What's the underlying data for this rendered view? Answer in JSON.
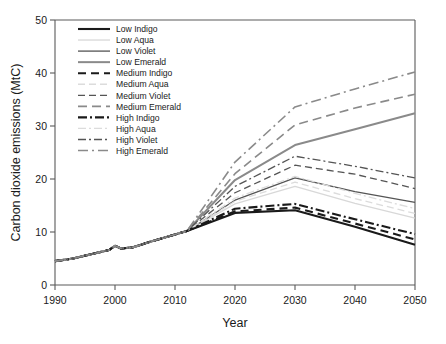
{
  "chart_data": {
    "type": "line",
    "title": "",
    "xlabel": "Year",
    "ylabel": "Carbon dioxide emissions (MtC)",
    "xlim": [
      1990,
      2050
    ],
    "ylim": [
      0,
      50
    ],
    "xticks": [
      1990,
      2000,
      2010,
      2020,
      2030,
      2040,
      2050
    ],
    "yticks": [
      0,
      10,
      20,
      30,
      40,
      50
    ],
    "grid": false,
    "legend_position": "top-left",
    "x": [
      1990,
      1993,
      1996,
      1999,
      2000,
      2001,
      2003,
      2006,
      2009,
      2012,
      2020,
      2030,
      2040,
      2050
    ],
    "series": [
      {
        "name": "Low  Indigo",
        "color": "#1a1a1a",
        "dash": "solid",
        "width": 2.1,
        "values": [
          4.5,
          5.0,
          5.8,
          6.6,
          7.4,
          6.9,
          7.1,
          8.2,
          9.2,
          10.2,
          13.6,
          14.1,
          11.0,
          7.6
        ]
      },
      {
        "name": "Low Aqua",
        "color": "#d8d8d8",
        "dash": "solid",
        "width": 1.3,
        "values": [
          4.5,
          5.0,
          5.8,
          6.6,
          7.4,
          6.9,
          7.1,
          8.2,
          9.2,
          10.2,
          15.3,
          18.6,
          15.4,
          12.6
        ]
      },
      {
        "name": "Low Violet",
        "color": "#555555",
        "dash": "solid",
        "width": 1.3,
        "values": [
          4.5,
          5.0,
          5.8,
          6.6,
          7.4,
          6.9,
          7.1,
          8.2,
          9.2,
          10.2,
          16.0,
          20.2,
          17.6,
          15.6
        ]
      },
      {
        "name": "Low Emerald",
        "color": "#8a8a8a",
        "dash": "solid",
        "width": 2.0,
        "values": [
          4.5,
          5.0,
          5.8,
          6.6,
          7.4,
          6.9,
          7.1,
          8.2,
          9.2,
          10.2,
          19.8,
          26.4,
          29.4,
          32.4
        ]
      },
      {
        "name": "Medium Indigo",
        "color": "#1a1a1a",
        "dash": "8,5",
        "width": 2.1,
        "values": [
          4.5,
          5.0,
          5.8,
          6.6,
          7.4,
          6.9,
          7.1,
          8.2,
          9.2,
          10.2,
          13.9,
          14.6,
          11.6,
          8.6
        ]
      },
      {
        "name": "Medium Aqua",
        "color": "#dcdcdc",
        "dash": "7,4",
        "width": 1.3,
        "values": [
          4.5,
          5.0,
          5.8,
          6.6,
          7.4,
          6.9,
          7.1,
          8.2,
          9.2,
          10.2,
          15.8,
          19.4,
          16.3,
          13.5
        ]
      },
      {
        "name": "Medium Violet",
        "color": "#555555",
        "dash": "7,4",
        "width": 1.3,
        "values": [
          4.5,
          5.0,
          5.8,
          6.6,
          7.4,
          6.9,
          7.1,
          8.2,
          9.2,
          10.2,
          17.4,
          22.6,
          20.9,
          18.2
        ]
      },
      {
        "name": "Medium Emerald",
        "color": "#8a8a8a",
        "dash": "9,5",
        "width": 1.6,
        "values": [
          4.5,
          5.0,
          5.8,
          6.6,
          7.4,
          6.9,
          7.1,
          8.2,
          9.2,
          10.2,
          21.0,
          30.2,
          33.4,
          36.0
        ]
      },
      {
        "name": "High Indigo",
        "color": "#1a1a1a",
        "dash": "9,3,2,3",
        "width": 2.1,
        "values": [
          4.5,
          5.0,
          5.8,
          6.6,
          7.4,
          6.9,
          7.1,
          8.2,
          9.2,
          10.2,
          14.4,
          15.3,
          12.4,
          9.6
        ]
      },
      {
        "name": "High Aqua",
        "color": "#dcdcdc",
        "dash": "8,3,2,3",
        "width": 1.3,
        "values": [
          4.5,
          5.0,
          5.8,
          6.6,
          7.4,
          6.9,
          7.1,
          8.2,
          9.2,
          10.2,
          16.4,
          20.5,
          17.3,
          14.4
        ]
      },
      {
        "name": "High Violet",
        "color": "#555555",
        "dash": "8,3,2,3",
        "width": 1.3,
        "values": [
          4.5,
          5.0,
          5.8,
          6.6,
          7.4,
          6.9,
          7.1,
          8.2,
          9.2,
          10.2,
          18.6,
          24.3,
          22.4,
          20.2
        ]
      },
      {
        "name": "High Emerald",
        "color": "#8a8a8a",
        "dash": "10,4,2,4",
        "width": 1.6,
        "values": [
          4.5,
          5.0,
          5.8,
          6.6,
          7.4,
          6.9,
          7.1,
          8.2,
          9.2,
          10.2,
          23.2,
          33.6,
          37.0,
          40.2
        ]
      }
    ]
  },
  "axes": {
    "x_title": "Year",
    "y_title": "Carbon dioxide emissions (MtC)",
    "x_ticklabels": [
      "1990",
      "2000",
      "2010",
      "2020",
      "2030",
      "2040",
      "2050"
    ],
    "y_ticklabels": [
      "0",
      "10",
      "20",
      "30",
      "40",
      "50"
    ]
  },
  "colors": {
    "indigo": "#1a1a1a",
    "aqua": "#dcdcdc",
    "violet": "#555555",
    "emerald": "#8a8a8a",
    "axis": "#5a5a5a",
    "background": "#ffffff"
  }
}
